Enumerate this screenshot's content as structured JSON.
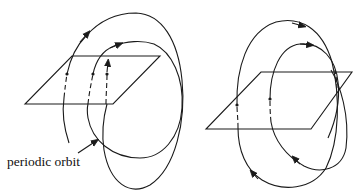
{
  "figure": {
    "label": "periodic orbit",
    "panels": [
      {
        "id": "left",
        "plane": [
          [
            72,
            56
          ],
          [
            160,
            56
          ],
          [
            113,
            104
          ],
          [
            25,
            104
          ]
        ],
        "crossings": [
          [
            67,
            74
          ],
          [
            93,
            74
          ],
          [
            107,
            74
          ]
        ]
      },
      {
        "id": "right",
        "plane": [
          [
            261,
            72
          ],
          [
            352,
            72
          ],
          [
            311,
            129
          ],
          [
            206,
            129
          ]
        ],
        "crossings": [
          [
            237,
            105
          ],
          [
            270,
            99
          ]
        ]
      }
    ],
    "colors": {
      "stroke": "#1a1a1a",
      "background": "#ffffff"
    }
  }
}
